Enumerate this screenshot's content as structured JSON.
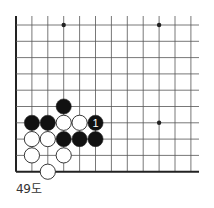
{
  "diagram": {
    "type": "go-board-fragment",
    "caption": "49도",
    "colors": {
      "background": "#ffffff",
      "grid_line": "#555555",
      "edge_line": "#222222",
      "black_stone": "#111111",
      "white_stone": "#ffffff",
      "stone_outline": "#222222",
      "label_on_black": "#ffffff"
    },
    "grid": {
      "origin_x": 16,
      "origin_y": 25,
      "spacing_x": 15.9,
      "spacing_y": 16.3,
      "columns": 12,
      "rows": 10,
      "left_edge": true,
      "bottom_edge": true,
      "top_edge": false,
      "right_edge": false,
      "line_extend_right_to": 199,
      "line_extend_top_to": 16
    },
    "star_points": [
      {
        "col": 3,
        "row": 0
      },
      {
        "col": 9,
        "row": 0
      },
      {
        "col": 9,
        "row": 6
      }
    ],
    "stones": [
      {
        "col": 3,
        "row": 5,
        "color": "black",
        "label": ""
      },
      {
        "col": 1,
        "row": 6,
        "color": "black",
        "label": ""
      },
      {
        "col": 2,
        "row": 6,
        "color": "black",
        "label": ""
      },
      {
        "col": 3,
        "row": 6,
        "color": "white",
        "label": ""
      },
      {
        "col": 4,
        "row": 6,
        "color": "white",
        "label": ""
      },
      {
        "col": 5,
        "row": 6,
        "color": "black",
        "label": "1"
      },
      {
        "col": 1,
        "row": 7,
        "color": "white",
        "label": ""
      },
      {
        "col": 2,
        "row": 7,
        "color": "white",
        "label": ""
      },
      {
        "col": 3,
        "row": 7,
        "color": "black",
        "label": ""
      },
      {
        "col": 4,
        "row": 7,
        "color": "black",
        "label": ""
      },
      {
        "col": 5,
        "row": 7,
        "color": "black",
        "label": ""
      },
      {
        "col": 1,
        "row": 8,
        "color": "white",
        "label": ""
      },
      {
        "col": 3,
        "row": 8,
        "color": "white",
        "label": ""
      },
      {
        "col": 2,
        "row": 9,
        "color": "white",
        "label": ""
      }
    ]
  }
}
